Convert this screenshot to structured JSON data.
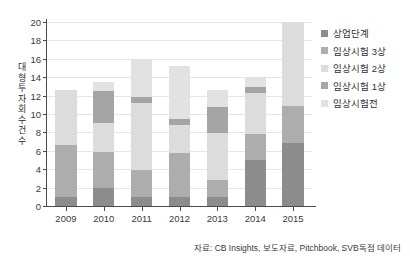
{
  "chart_data": {
    "type": "bar",
    "stacked": true,
    "title": "",
    "xlabel": "",
    "ylabel": "대형 투자 회수 건수",
    "ylabel_vertical_chars": "대\n형\n투\n자\n회\n수\n건\n수",
    "categories": [
      "2009",
      "2010",
      "2011",
      "2012",
      "2013",
      "2014",
      "2015"
    ],
    "ylim": [
      0,
      20
    ],
    "yticks": [
      0,
      2,
      4,
      6,
      8,
      10,
      12,
      14,
      16,
      18,
      20
    ],
    "grid": true,
    "legend_position": "right",
    "series": [
      {
        "name": "상업단계",
        "color": "#8c8c8c",
        "values": [
          0.95,
          2.0,
          1.0,
          0.95,
          1.0,
          4.95,
          6.85
        ]
      },
      {
        "name": "임상시험 3상",
        "color": "#adadad",
        "values": [
          5.65,
          3.9,
          2.9,
          4.8,
          1.85,
          2.85,
          4.0
        ]
      },
      {
        "name": "임상시험 2상",
        "color": "#dcdcdc",
        "values": [
          6.0,
          3.1,
          7.3,
          3.05,
          5.05,
          4.5,
          9.15
        ]
      },
      {
        "name": "임상시험 1상",
        "color": "#a5a5a5",
        "values": [
          0.0,
          3.5,
          0.7,
          0.7,
          2.9,
          0.65,
          0.0
        ]
      },
      {
        "name": "임상시험전",
        "color": "#e2e2e2",
        "values": [
          0.0,
          1.0,
          4.1,
          5.7,
          1.8,
          1.05,
          0.0
        ]
      }
    ],
    "totals": [
      12.6,
      13.5,
      16.0,
      15.2,
      12.6,
      14.0,
      20.0
    ],
    "source_note": "자료: CB Insights, 보도자료, Pitchbook, SVB독점 데이터"
  },
  "legend": {
    "items": [
      {
        "label": "상업단계",
        "color": "#8c8c8c"
      },
      {
        "label": "임상시험 3상",
        "color": "#adadad"
      },
      {
        "label": "임상시험 2상",
        "color": "#dcdcdc"
      },
      {
        "label": "임상시험 1상",
        "color": "#a5a5a5"
      },
      {
        "label": "임상시험전",
        "color": "#e2e2e2"
      }
    ]
  },
  "colors": {
    "axis": "#4a4a4a",
    "grid": "#e4e6e8",
    "text": "#2e2e2e",
    "background": "#ffffff"
  }
}
